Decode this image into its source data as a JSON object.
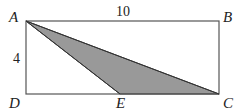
{
  "diagram": {
    "colors": {
      "stroke": "#555555",
      "shade": "#999999",
      "background": "#ffffff"
    },
    "vertices": {
      "A": {
        "label": "A",
        "x": 26,
        "y": 21
      },
      "B": {
        "label": "B",
        "x": 219,
        "y": 21
      },
      "C": {
        "label": "C",
        "x": 219,
        "y": 94
      },
      "D": {
        "label": "D",
        "x": 26,
        "y": 94
      },
      "E": {
        "label": "E",
        "x": 120,
        "y": 94
      }
    },
    "measurements": {
      "top_side": "10",
      "left_side": "4"
    },
    "shaded_region": [
      "A",
      "E",
      "C"
    ]
  }
}
